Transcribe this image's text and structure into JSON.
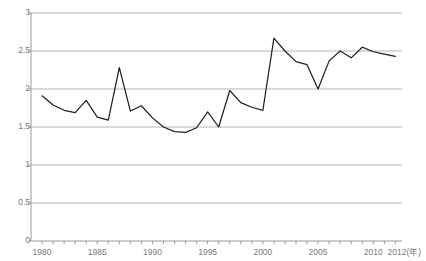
{
  "chart_data": {
    "type": "line",
    "title": "",
    "xlabel": "年",
    "ylabel": "",
    "xlim": [
      1979,
      2012.6
    ],
    "ylim": [
      0,
      3
    ],
    "grid": true,
    "legend": false,
    "x": [
      1980,
      1981,
      1982,
      1983,
      1984,
      1985,
      1986,
      1987,
      1988,
      1989,
      1990,
      1991,
      1992,
      1993,
      1994,
      1995,
      1996,
      1997,
      1998,
      1999,
      2000,
      2001,
      2002,
      2003,
      2004,
      2005,
      2006,
      2007,
      2008,
      2009,
      2010,
      2011,
      2012
    ],
    "values": [
      1.91,
      1.79,
      1.72,
      1.69,
      1.85,
      1.63,
      1.59,
      2.28,
      1.71,
      1.78,
      1.62,
      1.5,
      1.44,
      1.43,
      1.49,
      1.7,
      1.5,
      1.98,
      1.82,
      1.76,
      1.72,
      2.67,
      2.5,
      2.36,
      2.32,
      2.0,
      2.37,
      2.5,
      2.41,
      2.55,
      2.49,
      2.46,
      2.43
    ],
    "series": [
      {
        "name": "series-1",
        "color": "#231f20",
        "values": [
          1.91,
          1.79,
          1.72,
          1.69,
          1.85,
          1.63,
          1.59,
          2.28,
          1.71,
          1.78,
          1.62,
          1.5,
          1.44,
          1.43,
          1.49,
          1.7,
          1.5,
          1.98,
          1.82,
          1.76,
          1.72,
          2.67,
          2.5,
          2.36,
          2.32,
          2.0,
          2.37,
          2.5,
          2.41,
          2.55,
          2.49,
          2.46,
          2.43
        ]
      }
    ],
    "y_ticks": [
      0,
      0.5,
      1,
      1.5,
      2,
      2.5,
      3
    ],
    "y_tick_labels": [
      "0",
      "0.5",
      "1",
      "1.5",
      "2",
      "2.5",
      "3"
    ],
    "x_ticks": [
      1980,
      1985,
      1990,
      1995,
      2000,
      2005,
      2010,
      2012
    ],
    "x_tick_labels": [
      "1980",
      "1985",
      "1990",
      "1995",
      "2000",
      "2005",
      "2010",
      "2012"
    ],
    "x_axis_unit_label": "2012(年)",
    "colors": {
      "line": "#231f20",
      "grid": "#b4b4b4",
      "axis": "#9a9a9a",
      "tick_text": "#7b7b7b",
      "background": "#ffffff"
    }
  },
  "axes": {
    "y_labels": [
      {
        "text": "3",
        "value": 3
      },
      {
        "text": "2.5",
        "value": 2.5
      },
      {
        "text": "2",
        "value": 2
      },
      {
        "text": "1.5",
        "value": 1.5
      },
      {
        "text": "1",
        "value": 1
      },
      {
        "text": "0.5",
        "value": 0.5
      },
      {
        "text": "0",
        "value": 0
      }
    ],
    "x_labels": [
      {
        "text": "1980",
        "value": 1980
      },
      {
        "text": "1985",
        "value": 1985
      },
      {
        "text": "1990",
        "value": 1990
      },
      {
        "text": "1995",
        "value": 1995
      },
      {
        "text": "2000",
        "value": 2000
      },
      {
        "text": "2005",
        "value": 2005
      },
      {
        "text": "2010",
        "value": 2010
      },
      {
        "text": "2012(年)",
        "value": 2012
      }
    ]
  }
}
